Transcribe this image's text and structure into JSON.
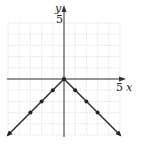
{
  "chart_data": {
    "type": "line",
    "title": "",
    "function": "y = -|x|",
    "xlabel": "x",
    "ylabel": "y",
    "xlim": [
      -5,
      5
    ],
    "ylim": [
      -5,
      5
    ],
    "grid": true,
    "tick_labels": {
      "x": [
        "5"
      ],
      "y": [
        "5"
      ]
    },
    "points": [
      {
        "x": -3,
        "y": -3
      },
      {
        "x": -2,
        "y": -2
      },
      {
        "x": -1,
        "y": -1
      },
      {
        "x": 0,
        "y": 0
      },
      {
        "x": 1,
        "y": -1
      },
      {
        "x": 2,
        "y": -2
      },
      {
        "x": 3,
        "y": -3
      }
    ],
    "line_extends_to": [
      {
        "x": -5,
        "y": -5
      },
      {
        "x": 5,
        "y": -5
      }
    ],
    "line_color": "#222222",
    "grid_color": "#d6d6d6"
  },
  "labels": {
    "x_axis": "x",
    "y_axis": "y",
    "x_tick": "5",
    "y_tick": "5"
  }
}
